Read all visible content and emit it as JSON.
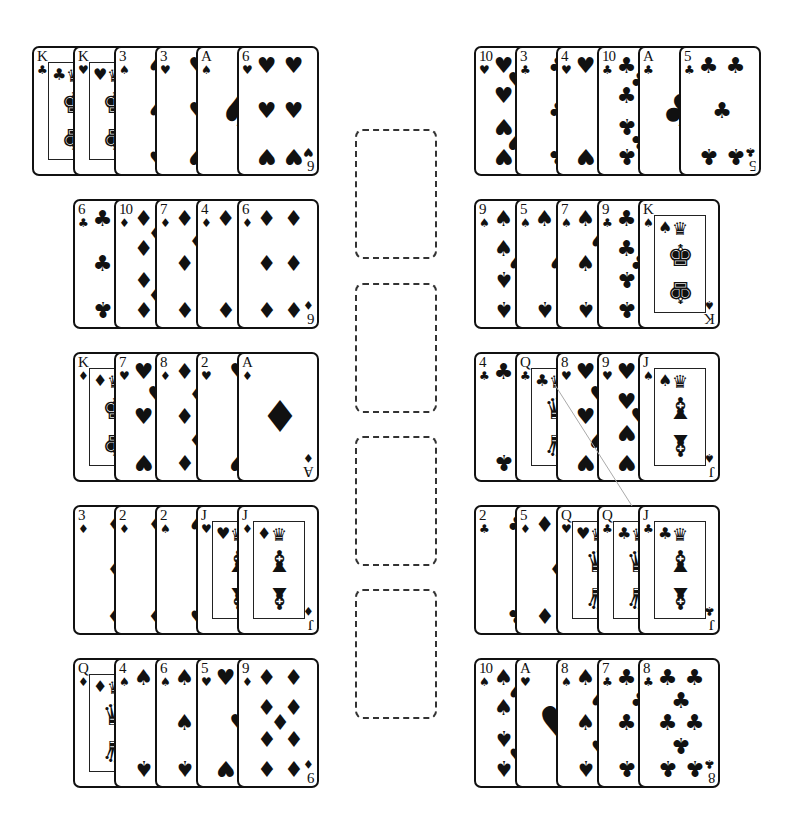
{
  "game": "Solitaire",
  "card_size": {
    "width": 82,
    "height": 130
  },
  "layout": {
    "left_x": [
      32,
      73,
      73,
      73,
      73
    ],
    "right_x": [
      474,
      474,
      474,
      474,
      474
    ],
    "row_y": [
      46,
      199,
      352,
      505,
      658
    ],
    "fan_offset": 41
  },
  "foundations": [
    {
      "id": "foundation-1",
      "y": 129
    },
    {
      "id": "foundation-2",
      "y": 283
    },
    {
      "id": "foundation-3",
      "y": 436
    },
    {
      "id": "foundation-4",
      "y": 589
    }
  ],
  "left_piles": [
    [
      {
        "rank": "K",
        "suit": "♣"
      },
      {
        "rank": "K",
        "suit": "♥"
      },
      {
        "rank": "3",
        "suit": "♠"
      },
      {
        "rank": "3",
        "suit": "♥"
      },
      {
        "rank": "A",
        "suit": "♠"
      },
      {
        "rank": "6",
        "suit": "♥"
      }
    ],
    [
      {
        "rank": "6",
        "suit": "♣"
      },
      {
        "rank": "10",
        "suit": "♦"
      },
      {
        "rank": "7",
        "suit": "♦"
      },
      {
        "rank": "4",
        "suit": "♦"
      },
      {
        "rank": "6",
        "suit": "♦"
      }
    ],
    [
      {
        "rank": "K",
        "suit": "♦"
      },
      {
        "rank": "7",
        "suit": "♥"
      },
      {
        "rank": "8",
        "suit": "♦"
      },
      {
        "rank": "2",
        "suit": "♥"
      },
      {
        "rank": "A",
        "suit": "♦"
      }
    ],
    [
      {
        "rank": "3",
        "suit": "♦"
      },
      {
        "rank": "2",
        "suit": "♦"
      },
      {
        "rank": "2",
        "suit": "♠"
      },
      {
        "rank": "J",
        "suit": "♥"
      },
      {
        "rank": "J",
        "suit": "♦"
      }
    ],
    [
      {
        "rank": "Q",
        "suit": "♦"
      },
      {
        "rank": "4",
        "suit": "♠"
      },
      {
        "rank": "6",
        "suit": "♠"
      },
      {
        "rank": "5",
        "suit": "♥"
      },
      {
        "rank": "9",
        "suit": "♦"
      }
    ]
  ],
  "right_piles": [
    [
      {
        "rank": "10",
        "suit": "♥"
      },
      {
        "rank": "3",
        "suit": "♣"
      },
      {
        "rank": "4",
        "suit": "♥"
      },
      {
        "rank": "10",
        "suit": "♣"
      },
      {
        "rank": "A",
        "suit": "♣"
      },
      {
        "rank": "5",
        "suit": "♣"
      }
    ],
    [
      {
        "rank": "9",
        "suit": "♠"
      },
      {
        "rank": "5",
        "suit": "♠"
      },
      {
        "rank": "7",
        "suit": "♠"
      },
      {
        "rank": "9",
        "suit": "♣"
      },
      {
        "rank": "K",
        "suit": "♠"
      }
    ],
    [
      {
        "rank": "4",
        "suit": "♣"
      },
      {
        "rank": "Q",
        "suit": "♣"
      },
      {
        "rank": "8",
        "suit": "♥"
      },
      {
        "rank": "9",
        "suit": "♥"
      },
      {
        "rank": "J",
        "suit": "♠"
      }
    ],
    [
      {
        "rank": "2",
        "suit": "♣"
      },
      {
        "rank": "5",
        "suit": "♦"
      },
      {
        "rank": "Q",
        "suit": "♥"
      },
      {
        "rank": "Q",
        "suit": "♣"
      },
      {
        "rank": "J",
        "suit": "♣"
      }
    ],
    [
      {
        "rank": "10",
        "suit": "♠"
      },
      {
        "rank": "A",
        "suit": "♥"
      },
      {
        "rank": "8",
        "suit": "♠"
      },
      {
        "rank": "7",
        "suit": "♣"
      },
      {
        "rank": "8",
        "suit": "♣"
      }
    ]
  ],
  "drag_line": {
    "x1": 555,
    "y1": 385,
    "x2": 632,
    "y2": 506,
    "color": "#aaaaaa"
  },
  "colors": {
    "card_border": "#111111",
    "ink": "#111111",
    "background": "#ffffff",
    "slot_border": "#333333"
  }
}
